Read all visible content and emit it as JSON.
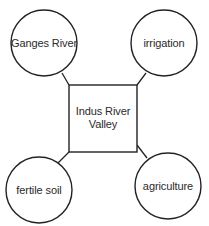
{
  "diagram": {
    "type": "concept-map",
    "center": {
      "label_line1": "Indus River",
      "label_line2": "Valley"
    },
    "nodes": [
      {
        "id": "top-left",
        "label": "Ganges River"
      },
      {
        "id": "top-right",
        "label": "irrigation"
      },
      {
        "id": "bottom-left",
        "label": "fertile soil"
      },
      {
        "id": "bottom-right",
        "label": "agriculture"
      }
    ],
    "colors": {
      "stroke": "#222222",
      "background": "#ffffff",
      "text": "#2a2a2a"
    }
  }
}
